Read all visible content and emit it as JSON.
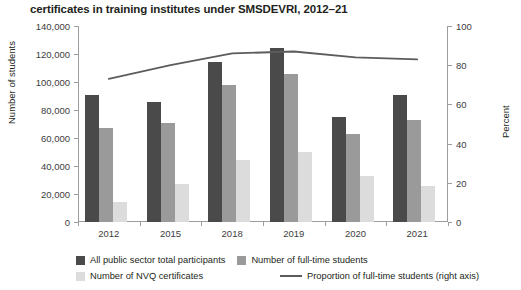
{
  "chart_data": {
    "type": "bar",
    "title": "certificates in training institutes under SMSDEVRI, 2012–21",
    "categories": [
      "2012",
      "2015",
      "2018",
      "2019",
      "2020",
      "2021"
    ],
    "xlabel": "",
    "ylabel": "Number of students",
    "ylim": [
      0,
      140000
    ],
    "y_ticks": [
      "0",
      "20,000",
      "40,000",
      "60,000",
      "80,000",
      "100,000",
      "120,000",
      "140,000"
    ],
    "y_tick_values": [
      0,
      20000,
      40000,
      60000,
      80000,
      100000,
      120000,
      140000
    ],
    "y2label": "Percent",
    "y2lim": [
      0,
      100
    ],
    "y2_ticks": [
      "0",
      "20",
      "40",
      "60",
      "80",
      "100"
    ],
    "y2_tick_values": [
      0,
      20,
      40,
      60,
      80,
      100
    ],
    "grid": false,
    "legend_position": "bottom",
    "series": [
      {
        "name": "All public sector total participants",
        "kind": "bar",
        "axis": "left",
        "color": "#4a4a4a",
        "values": [
          91000,
          86000,
          114000,
          124000,
          75000,
          91000
        ]
      },
      {
        "name": "Number of full-time students",
        "kind": "bar",
        "axis": "left",
        "color": "#9a9a9a",
        "values": [
          67000,
          71000,
          98000,
          106000,
          63000,
          73000
        ]
      },
      {
        "name": "Number of NVQ certificates",
        "kind": "bar",
        "axis": "left",
        "color": "#dcdcdc",
        "values": [
          14000,
          27000,
          44000,
          50000,
          33000,
          26000
        ]
      },
      {
        "name": "Proportion of full-time students (right axis)",
        "kind": "line",
        "axis": "right",
        "color": "#5c5c5c",
        "values": [
          73,
          80,
          86,
          87,
          84,
          83
        ]
      }
    ]
  }
}
